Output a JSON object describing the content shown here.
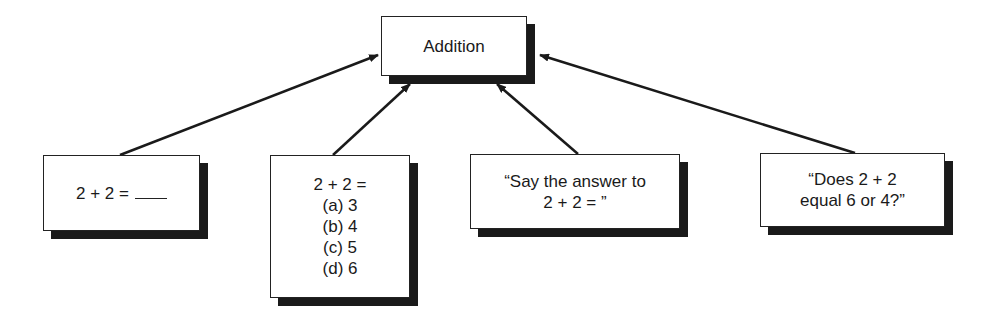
{
  "diagram": {
    "root": {
      "label": "Addition"
    },
    "children": [
      {
        "id": "fill-in",
        "label": "2 + 2 =",
        "blank": true
      },
      {
        "id": "multiple-choice",
        "stem": "2 + 2 =",
        "options": [
          "(a) 3",
          "(b) 4",
          "(c) 5",
          "(d) 6"
        ]
      },
      {
        "id": "oral-recall",
        "lines": [
          "“Say the answer to",
          "2 + 2 = ”"
        ]
      },
      {
        "id": "oral-choice",
        "lines": [
          "“Does 2 + 2",
          "equal 6 or 4?”"
        ]
      }
    ],
    "edges": [
      {
        "from": "fill-in",
        "to": "root"
      },
      {
        "from": "multiple-choice",
        "to": "root"
      },
      {
        "from": "oral-recall",
        "to": "root"
      },
      {
        "from": "oral-choice",
        "to": "root"
      }
    ]
  }
}
